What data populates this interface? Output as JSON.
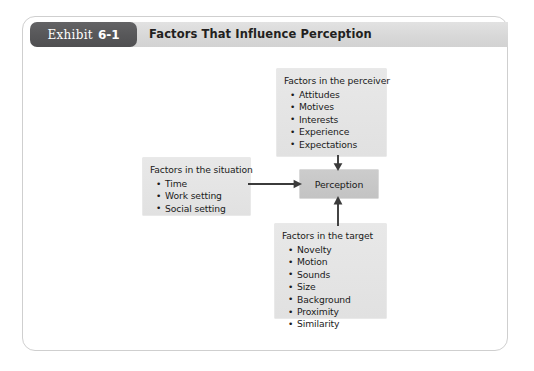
{
  "exhibit": {
    "badge_word": "Exhibit",
    "badge_number": "6-1",
    "title": "Factors That Influence Perception"
  },
  "diagram": {
    "center": {
      "label": "Perception"
    },
    "nodes": [
      {
        "id": "perceiver",
        "heading": "Factors in the perceiver",
        "items": [
          "Attitudes",
          "Motives",
          "Interests",
          "Experience",
          "Expectations"
        ]
      },
      {
        "id": "situation",
        "heading": "Factors in the situation",
        "items": [
          "Time",
          "Work setting",
          "Social setting"
        ]
      },
      {
        "id": "target",
        "heading": "Factors in the target",
        "items": [
          "Novelty",
          "Motion",
          "Sounds",
          "Size",
          "Background",
          "Proximity",
          "Similarity"
        ]
      }
    ],
    "arrows": [
      {
        "id": "perceiver-to-perception",
        "direction": "down"
      },
      {
        "id": "target-to-perception",
        "direction": "up"
      },
      {
        "id": "situation-to-perception",
        "direction": "right"
      }
    ]
  },
  "colors": {
    "badge_bg": "#58585a",
    "title_bar_bg": "#dcdcdc",
    "node_bg": "#e3e3e3",
    "center_bg": "#c6c6c6",
    "frame_border": "#cfcfcf",
    "arrow": "#3b3b3b",
    "text": "#1a1a1a"
  }
}
